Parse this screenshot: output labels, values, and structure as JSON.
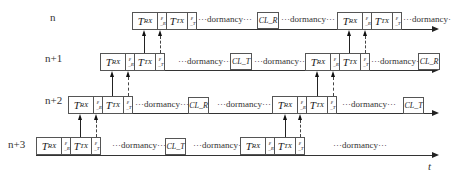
{
  "rows": [
    {
      "label": "n"
    },
    {
      "label": "n+1"
    },
    {
      "label": "n+2"
    },
    {
      "label": "n+3"
    }
  ],
  "cells": {
    "trx_main": "T",
    "trx_sub": "RX",
    "ttx_main": "T",
    "ttx_sub": "TX",
    "eps_r_main": "ε",
    "eps_r_sub": "_R",
    "eps_t_main": "ε",
    "eps_t_sub": "_T"
  },
  "cl": {
    "r": "CL_R",
    "t": "CL_T"
  },
  "dormancy_text": "···dormancy···",
  "dormancy_end_text": "···dormancy·",
  "axis_label": "t",
  "colors": {
    "line": "#222222",
    "border": "#555555",
    "background": "#ffffff"
  }
}
